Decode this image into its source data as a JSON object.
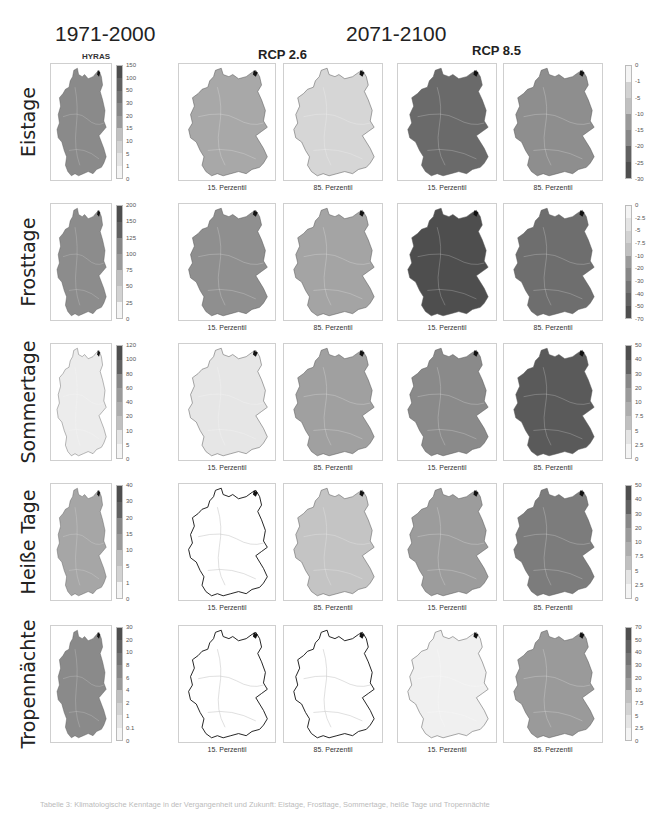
{
  "header": {
    "period_baseline": "1971-2000",
    "period_future": "2071-2100",
    "baseline_source": "HYRAS",
    "scenario_low": "RCP 2.6",
    "scenario_high": "RCP 8.5"
  },
  "percentile_labels": {
    "p15": "15. Perzentil",
    "p85": "85. Perzentil"
  },
  "rows": [
    {
      "label": "Eistage",
      "left_legend": [
        "150",
        "100",
        "50",
        "30",
        "20",
        "15",
        "10",
        "5",
        "1",
        "0"
      ],
      "right_legend": [
        "0",
        "-1",
        "-5",
        "-10",
        "-15",
        "-20",
        "-25",
        "-30"
      ],
      "shades": {
        "hyras": "#8a8a8a",
        "rcp26_p15": "#a8a8a8",
        "rcp26_p85": "#d6d6d6",
        "rcp85_p15": "#6a6a6a",
        "rcp85_p85": "#8e8e8e"
      }
    },
    {
      "label": "Frosttage",
      "left_legend": [
        "200",
        "150",
        "125",
        "100",
        "75",
        "50",
        "25",
        "0"
      ],
      "right_legend": [
        "0",
        "-2.5",
        "-5",
        "-7.5",
        "-10",
        "-20",
        "-30",
        "-40",
        "-50",
        "-70"
      ],
      "shades": {
        "hyras": "#8c8c8c",
        "rcp26_p15": "#8f8f8f",
        "rcp26_p85": "#a4a4a4",
        "rcp85_p15": "#4e4e4e",
        "rcp85_p85": "#6e6e6e"
      }
    },
    {
      "label": "Sommertage",
      "left_legend": [
        "120",
        "100",
        "80",
        "60",
        "40",
        "20",
        "10",
        "5",
        "0"
      ],
      "right_legend": [
        "50",
        "40",
        "30",
        "20",
        "10",
        "7.5",
        "5",
        "2.5",
        "0"
      ],
      "shades": {
        "hyras": "#ececec",
        "rcp26_p15": "#e6e6e6",
        "rcp26_p85": "#a0a0a0",
        "rcp85_p15": "#8a8a8a",
        "rcp85_p85": "#5a5a5a"
      }
    },
    {
      "label": "Heiße Tage",
      "left_legend": [
        "40",
        "30",
        "20",
        "15",
        "10",
        "5",
        "1",
        "0"
      ],
      "right_legend": [
        "50",
        "40",
        "30",
        "20",
        "10",
        "7.5",
        "5",
        "2.5",
        "0"
      ],
      "shades": {
        "hyras": "#a6a6a6",
        "rcp26_p15": "#ffffff",
        "rcp26_p85": "#c4c4c4",
        "rcp85_p15": "#9c9c9c",
        "rcp85_p85": "#7c7c7c"
      }
    },
    {
      "label": "Tropennächte",
      "left_legend": [
        "30",
        "20",
        "10",
        "8",
        "6",
        "4",
        "2",
        "1",
        "0.1",
        "0"
      ],
      "right_legend": [
        "70",
        "50",
        "40",
        "30",
        "20",
        "10",
        "7.5",
        "5",
        "2.5",
        "0"
      ],
      "shades": {
        "hyras": "#8a8a8a",
        "rcp26_p15": "#ffffff",
        "rcp26_p85": "#ffffff",
        "rcp85_p15": "#f0f0f0",
        "rcp85_p85": "#9a9a9a"
      }
    }
  ],
  "footer": {
    "caption": "Tabelle 3: Klimatologische Kenntage in der Vergangenheit und Zukunft: Eistage, Frosttage, Sommertage, heiße Tage und Tropennächte"
  }
}
